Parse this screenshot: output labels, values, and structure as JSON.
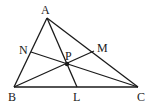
{
  "diagram": {
    "type": "geometry-triangle-cevians",
    "points": {
      "A": {
        "label": "A",
        "x": 47,
        "y": 18
      },
      "B": {
        "label": "B",
        "x": 14,
        "y": 87
      },
      "C": {
        "label": "C",
        "x": 138,
        "y": 87
      },
      "L": {
        "label": "L",
        "x": 77,
        "y": 87
      },
      "M": {
        "label": "M",
        "x": 94,
        "y": 51
      },
      "N": {
        "label": "N",
        "x": 31,
        "y": 52
      },
      "P": {
        "label": "P",
        "x": 67,
        "y": 64
      }
    },
    "segments": [
      [
        "A",
        "B"
      ],
      [
        "B",
        "C"
      ],
      [
        "C",
        "A"
      ],
      [
        "A",
        "L"
      ],
      [
        "B",
        "M"
      ],
      [
        "C",
        "N"
      ]
    ],
    "colors": {
      "line": "#1a1a1a",
      "background": "#ffffff"
    }
  }
}
